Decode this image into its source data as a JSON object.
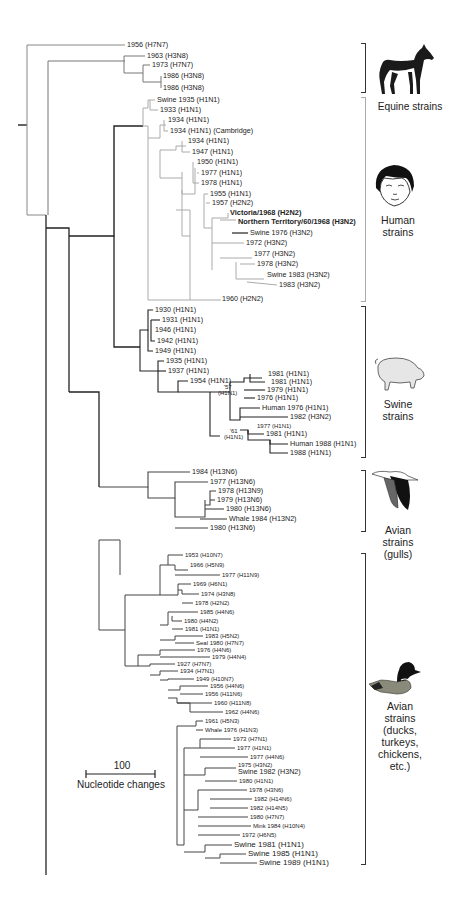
{
  "scale_bar": {
    "value": "100",
    "label": "Nucleotide changes"
  },
  "groups": [
    {
      "name": "equine",
      "label": "Equine strains",
      "icon": "horse-icon"
    },
    {
      "name": "human",
      "label_lines": [
        "Human",
        "strains"
      ],
      "icon": "child-face-icon"
    },
    {
      "name": "swine",
      "label_lines": [
        "Swine",
        "strains"
      ],
      "icon": "pig-icon"
    },
    {
      "name": "gulls",
      "label_lines": [
        "Avian",
        "strains",
        "(gulls)"
      ],
      "icon": "gull-icon"
    },
    {
      "name": "avian",
      "label_lines": [
        "Avian",
        "strains",
        "(ducks,",
        "turkeys,",
        "chickens,",
        "etc.)"
      ],
      "icon": "duck-icon"
    }
  ],
  "leaves": [
    {
      "label": "1956 (H7N7)",
      "x": 127,
      "y": 45
    },
    {
      "label": "1963 (H3N8)",
      "x": 147,
      "y": 56
    },
    {
      "label": "1973 (H7N7)",
      "x": 152,
      "y": 65
    },
    {
      "label": "1986 (H3N8)",
      "x": 163,
      "y": 76
    },
    {
      "label": "1986 (H3N8)",
      "x": 163,
      "y": 88
    },
    {
      "label": "Swine 1935 (H1N1)",
      "x": 157,
      "y": 100
    },
    {
      "label": "1933 (H1N1)",
      "x": 160,
      "y": 110
    },
    {
      "label": "1934 (H1N1)",
      "x": 168,
      "y": 120
    },
    {
      "label": "1934 (H1N1) (Cambridge)",
      "x": 170,
      "y": 131
    },
    {
      "label": "1934 (H1N1)",
      "x": 188,
      "y": 141
    },
    {
      "label": "1947 (H1N1)",
      "x": 192,
      "y": 152
    },
    {
      "label": "1950 (H1N1)",
      "x": 197,
      "y": 162
    },
    {
      "label": "1977 (H1N1)",
      "x": 201,
      "y": 173
    },
    {
      "label": "1978 (H1N1)",
      "x": 201,
      "y": 183
    },
    {
      "label": "1955 (H1N1)",
      "x": 210,
      "y": 194
    },
    {
      "label": "1957 (H2N2)",
      "x": 212,
      "y": 203
    },
    {
      "label": "Victoria/1968 (H2N2)",
      "x": 230,
      "y": 213,
      "bold": true
    },
    {
      "label": "Northern Territory/60/1968 (H3N2)",
      "x": 238,
      "y": 222,
      "bold": true
    },
    {
      "label": "Swine 1976 (H3N2)",
      "x": 250,
      "y": 233
    },
    {
      "label": "1972 (H3N2)",
      "x": 246,
      "y": 243
    },
    {
      "label": "1977 (H3N2)",
      "x": 254,
      "y": 254
    },
    {
      "label": "1978 (H3N2)",
      "x": 257,
      "y": 264
    },
    {
      "label": "Swine 1983 (H3N2)",
      "x": 267,
      "y": 275
    },
    {
      "label": "1983 (H3N2)",
      "x": 279,
      "y": 285
    },
    {
      "label": "1960 (H2N2)",
      "x": 222,
      "y": 299
    },
    {
      "label": "1930 (H1N1)",
      "x": 155,
      "y": 310
    },
    {
      "label": "1931 (H1N1)",
      "x": 162,
      "y": 320
    },
    {
      "label": "1946 (H1N1)",
      "x": 155,
      "y": 330
    },
    {
      "label": "1942 (H1N1)",
      "x": 157,
      "y": 341
    },
    {
      "label": "1949 (H1N1)",
      "x": 155,
      "y": 351
    },
    {
      "label": "1935 (H1N1)",
      "x": 166,
      "y": 361
    },
    {
      "label": "1937 (H1N1)",
      "x": 168,
      "y": 371
    },
    {
      "label": "1954 (H1N1)",
      "x": 190,
      "y": 381
    },
    {
      "label": "'57\n(H1N1)",
      "x": 218,
      "y": 388,
      "small": true
    },
    {
      "label": "1981 (H1N1)",
      "x": 268,
      "y": 374
    },
    {
      "label": "1981 (H1N1)",
      "x": 271,
      "y": 382
    },
    {
      "label": "1979 (H1N1)",
      "x": 267,
      "y": 390
    },
    {
      "label": "1976 (H1N1)",
      "x": 257,
      "y": 398
    },
    {
      "label": "Human 1976 (H1N1)",
      "x": 262,
      "y": 408
    },
    {
      "label": "1982 (H3N2)",
      "x": 290,
      "y": 417
    },
    {
      "label": "1977 (H1N1)",
      "x": 257,
      "y": 426,
      "small": true
    },
    {
      "label": "1981 (H1N1)",
      "x": 266,
      "y": 434
    },
    {
      "label": "'61\n(H1N1)",
      "x": 224,
      "y": 432,
      "small": true
    },
    {
      "label": "Human 1988 (H1N1)",
      "x": 290,
      "y": 444
    },
    {
      "label": "1988 (H1N1)",
      "x": 290,
      "y": 453
    },
    {
      "label": "1984 (H13N6)",
      "x": 192,
      "y": 472
    },
    {
      "label": "1977 (H13N6)",
      "x": 210,
      "y": 482
    },
    {
      "label": "1978 (H13N9)",
      "x": 218,
      "y": 491
    },
    {
      "label": "1979 (H13N6)",
      "x": 217,
      "y": 500
    },
    {
      "label": "1980 (H13N6)",
      "x": 226,
      "y": 509
    },
    {
      "label": "Whale 1984 (H13N2)",
      "x": 229,
      "y": 519
    },
    {
      "label": "1980 (H13N6)",
      "x": 210,
      "y": 528
    },
    {
      "label": "1953 (H10N7)",
      "x": 185,
      "y": 555,
      "small": true
    },
    {
      "label": "1966 (H5N9)",
      "x": 190,
      "y": 565,
      "small": true
    },
    {
      "label": "1977 (H11N9)",
      "x": 222,
      "y": 575,
      "small": true
    },
    {
      "label": "1969 (H6N1)",
      "x": 193,
      "y": 584,
      "small": true
    },
    {
      "label": "1974 (H3N8)",
      "x": 201,
      "y": 594,
      "small": true
    },
    {
      "label": "1978 (H2N2)",
      "x": 195,
      "y": 603,
      "small": true
    },
    {
      "label": "1985 (H4N6)",
      "x": 200,
      "y": 612,
      "small": true
    },
    {
      "label": "1980 (H4N2)",
      "x": 184,
      "y": 621,
      "small": true
    },
    {
      "label": "1981 (H1N1)",
      "x": 185,
      "y": 629,
      "small": true
    },
    {
      "label": "1983 (H5N2)",
      "x": 205,
      "y": 636,
      "small": true
    },
    {
      "label": "Seal 1980 (H7N7)",
      "x": 196,
      "y": 643,
      "small": true
    },
    {
      "label": "1976 (H4N6)",
      "x": 197,
      "y": 650,
      "small": true
    },
    {
      "label": "1979 (H4N4)",
      "x": 212,
      "y": 657,
      "small": true
    },
    {
      "label": "1927 (H7N7)",
      "x": 177,
      "y": 664,
      "small": true
    },
    {
      "label": "1934 (H7N1)",
      "x": 180,
      "y": 671,
      "small": true
    },
    {
      "label": "1949 (H10N7)",
      "x": 196,
      "y": 679,
      "small": true
    },
    {
      "label": "1956 (H4N6)",
      "x": 210,
      "y": 686,
      "small": true
    },
    {
      "label": "1956 (H11N6)",
      "x": 205,
      "y": 694,
      "small": true
    },
    {
      "label": "1960 (H11N8)",
      "x": 214,
      "y": 703,
      "small": true
    },
    {
      "label": "1962 (H4N6)",
      "x": 225,
      "y": 712,
      "small": true
    },
    {
      "label": "1961 (H5N3)",
      "x": 205,
      "y": 721,
      "small": true
    },
    {
      "label": "Whale 1976 (H1N3)",
      "x": 205,
      "y": 730,
      "small": true
    },
    {
      "label": "1973 (H7N1)",
      "x": 233,
      "y": 739,
      "small": true
    },
    {
      "label": "1977 (H1N1)",
      "x": 237,
      "y": 748,
      "small": true
    },
    {
      "label": "1977 (H4N6)",
      "x": 250,
      "y": 757,
      "small": true
    },
    {
      "label": "1975 (H3N2)",
      "x": 238,
      "y": 765,
      "small": true
    },
    {
      "label": "Swine 1982 (H3N2)",
      "x": 238,
      "y": 772
    },
    {
      "label": "1980 (H1N1)",
      "x": 239,
      "y": 781,
      "small": true
    },
    {
      "label": "1978 (H3N6)",
      "x": 249,
      "y": 790,
      "small": true
    },
    {
      "label": "1982 (H14N6)",
      "x": 254,
      "y": 799,
      "small": true
    },
    {
      "label": "1982 (H14N5)",
      "x": 250,
      "y": 808,
      "small": true
    },
    {
      "label": "1980 (H7N7)",
      "x": 250,
      "y": 817,
      "small": true
    },
    {
      "label": "Mink 1984 (H10N4)",
      "x": 253,
      "y": 826,
      "small": true
    },
    {
      "label": "1972 (H6N5)",
      "x": 242,
      "y": 835,
      "small": true
    },
    {
      "label": "Swine 1981 (H1N1)",
      "x": 234,
      "y": 845,
      "big": true
    },
    {
      "label": "Swine 1985 (H1N1)",
      "x": 248,
      "y": 854,
      "big": true
    },
    {
      "label": "Swine 1989 (H1N1)",
      "x": 259,
      "y": 863,
      "big": true
    }
  ]
}
